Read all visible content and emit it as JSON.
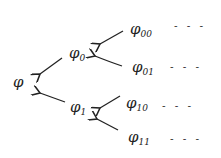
{
  "diagram": {
    "type": "binary-tree",
    "root": {
      "symbol": "φ",
      "sub": ""
    },
    "level1": [
      {
        "symbol": "φ",
        "sub": "0"
      },
      {
        "symbol": "φ",
        "sub": "1"
      }
    ],
    "level2": [
      {
        "symbol": "φ",
        "sub": "00",
        "continuation": "- - -"
      },
      {
        "symbol": "φ",
        "sub": "01",
        "continuation": "- - -"
      },
      {
        "symbol": "φ",
        "sub": "10",
        "continuation": "- - -"
      },
      {
        "symbol": "φ",
        "sub": "11",
        "continuation": "- - -"
      }
    ],
    "edges": [
      {
        "from": "φ0",
        "to": "φ"
      },
      {
        "from": "φ1",
        "to": "φ"
      },
      {
        "from": "φ00",
        "to": "φ0"
      },
      {
        "from": "φ01",
        "to": "φ0"
      },
      {
        "from": "φ10",
        "to": "φ1"
      },
      {
        "from": "φ11",
        "to": "φ1"
      }
    ],
    "stroke_color": "#222222"
  }
}
